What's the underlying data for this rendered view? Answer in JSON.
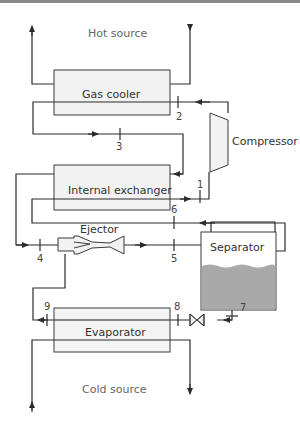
{
  "diagram": {
    "labels": {
      "hot_source": "Hot source",
      "cold_source": "Cold source",
      "gas_cooler": "Gas cooler",
      "compressor": "Compressor",
      "internal_exchanger": "Internal exchanger",
      "ejector": "Ejector",
      "separator": "Separator",
      "evaporator": "Evaporator"
    },
    "state_points": [
      "1",
      "2",
      "3",
      "4",
      "5",
      "6",
      "7",
      "8",
      "9"
    ],
    "colors": {
      "line": "#2b2b2b",
      "box_fill": "#f2f2f2",
      "box_stroke": "#3a3a3a",
      "liquid": "#a9a9a9",
      "text": "#333333"
    }
  }
}
